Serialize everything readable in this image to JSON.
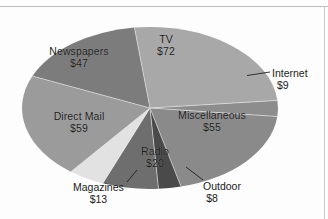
{
  "figure": {
    "background_color": "#fdfdfd",
    "rule_color": "#bdbdbd"
  },
  "chart_data": {
    "type": "pie",
    "title": "",
    "subtitle": "",
    "xlabel": "",
    "ylabel": "",
    "units": "dollars (billions)",
    "total": 283,
    "legend_position": "none",
    "labels_show_value": true,
    "value_prefix": "$",
    "categories": [
      "TV",
      "Internet",
      "Miscellaneous",
      "Outdoor",
      "Radio",
      "Magazines",
      "Direct Mail",
      "Newspapers"
    ],
    "values": [
      72,
      9,
      55,
      8,
      20,
      13,
      59,
      47
    ],
    "colors": [
      "#a8a8a8",
      "#8d8d8d",
      "#8a8a8a",
      "#4a4a4a",
      "#6e6e6e",
      "#e2e2e2",
      "#9b9b9b",
      "#7c7c7c"
    ],
    "slices": [
      {
        "name": "TV",
        "label": "TV",
        "value_label": "$72",
        "value": 72,
        "color": "#a8a8a8",
        "label_placement": "inside",
        "label_x": 166,
        "label_y": 40,
        "leader_line": false
      },
      {
        "name": "Internet",
        "label": "Internet",
        "value_label": "$9",
        "value": 9,
        "color": "#8d8d8d",
        "label_placement": "outside",
        "label_x": 272,
        "label_y": 68,
        "leader_line": true
      },
      {
        "name": "Miscellaneous",
        "label": "Miscellaneous",
        "value_label": "$55",
        "value": 55,
        "color": "#8a8a8a",
        "label_placement": "inside",
        "label_x": 212,
        "label_y": 116,
        "leader_line": false
      },
      {
        "name": "Outdoor",
        "label": "Outdoor",
        "value_label": "$8",
        "value": 8,
        "color": "#4a4a4a",
        "label_placement": "outside",
        "label_x": 203,
        "label_y": 181,
        "leader_line": true
      },
      {
        "name": "Radio",
        "label": "Radio",
        "value_label": "$20",
        "value": 20,
        "color": "#6e6e6e",
        "label_placement": "inside",
        "label_x": 155,
        "label_y": 152,
        "leader_line": false
      },
      {
        "name": "Magazines",
        "label": "Magazines",
        "value_label": "$13",
        "value": 13,
        "color": "#e2e2e2",
        "label_placement": "outside",
        "label_x": 73,
        "label_y": 182,
        "leader_line": true
      },
      {
        "name": "Direct Mail",
        "label": "Direct Mail",
        "value_label": "$59",
        "value": 59,
        "color": "#9b9b9b",
        "label_placement": "inside",
        "label_x": 78,
        "label_y": 117,
        "leader_line": false
      },
      {
        "name": "Newspapers",
        "label": "Newspapers",
        "value_label": "$47",
        "value": 47,
        "color": "#7c7c7c",
        "label_placement": "inside",
        "label_x": 79,
        "label_y": 52,
        "leader_line": false
      }
    ]
  }
}
